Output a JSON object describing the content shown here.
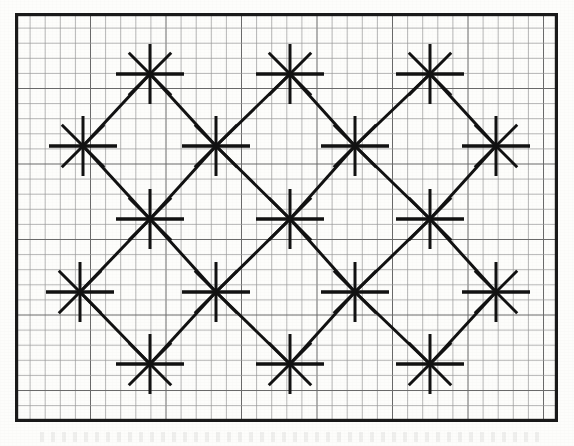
{
  "document": {
    "title": "Lattice Star Pattern Figure",
    "kind": "scanned-diagram",
    "background_color": "#fdfdfb"
  },
  "canvas": {
    "width": 574,
    "height": 446
  },
  "frame": {
    "name": "outer-border",
    "x": 15,
    "y": 13,
    "width": 543,
    "height": 409,
    "stroke_color": "#1a1a1a",
    "stroke_width": 3.2
  },
  "graph_paper": {
    "name": "grid",
    "cell_size": 15.1,
    "minor_line_color": "#9a9a9a",
    "minor_line_width": 0.7,
    "major_line_color": "#6a6a6a",
    "major_line_width": 1.0,
    "major_every": 5,
    "visible": true
  },
  "star_glyph": {
    "ray_count": 8,
    "stroke_color": "#121212",
    "vertical_half_length": 30,
    "horizontal_half_length": 34,
    "diagonal_half_length": 30,
    "vertical_stroke_width": 3.0,
    "horizontal_stroke_width": 3.4,
    "diagonal_stroke_width": 3.0,
    "angles_deg": [
      0,
      45,
      90,
      135,
      180,
      225,
      270,
      315
    ]
  },
  "lattice": {
    "description": "Staggered diamond lattice of 8-ray star nodes joined by diagonal connector lines",
    "row_spacing": 72.5,
    "column_spacing": 140,
    "rows": [
      {
        "index": 0,
        "y": 74,
        "offset": "odd",
        "count": 3,
        "centers_x": [
          150,
          290,
          430
        ]
      },
      {
        "index": 1,
        "y": 146,
        "offset": "even",
        "count": 4,
        "centers_x": [
          83,
          216,
          355,
          496
        ]
      },
      {
        "index": 2,
        "y": 219,
        "offset": "odd",
        "count": 3,
        "centers_x": [
          150,
          290,
          430
        ]
      },
      {
        "index": 3,
        "y": 292,
        "offset": "even",
        "count": 4,
        "centers_x": [
          80,
          216,
          355,
          496
        ]
      },
      {
        "index": 4,
        "y": 364,
        "offset": "odd",
        "count": 3,
        "centers_x": [
          150,
          290,
          430
        ]
      }
    ],
    "node_total": 17
  },
  "connectors": {
    "name": "diagonal-lattice-links",
    "stroke_color": "#121212",
    "stroke_width": 3.0,
    "orientation": "45-degree diagonals joining nearest neighbours between adjacent rows"
  },
  "edge_clipping": {
    "note": "Rays and connectors are clipped at the outer border; nodes near the left and right edges show shortened arms"
  },
  "caption": {
    "visible_text": "",
    "present": true,
    "note": "faint illegible scanner smudge beneath the frame"
  }
}
